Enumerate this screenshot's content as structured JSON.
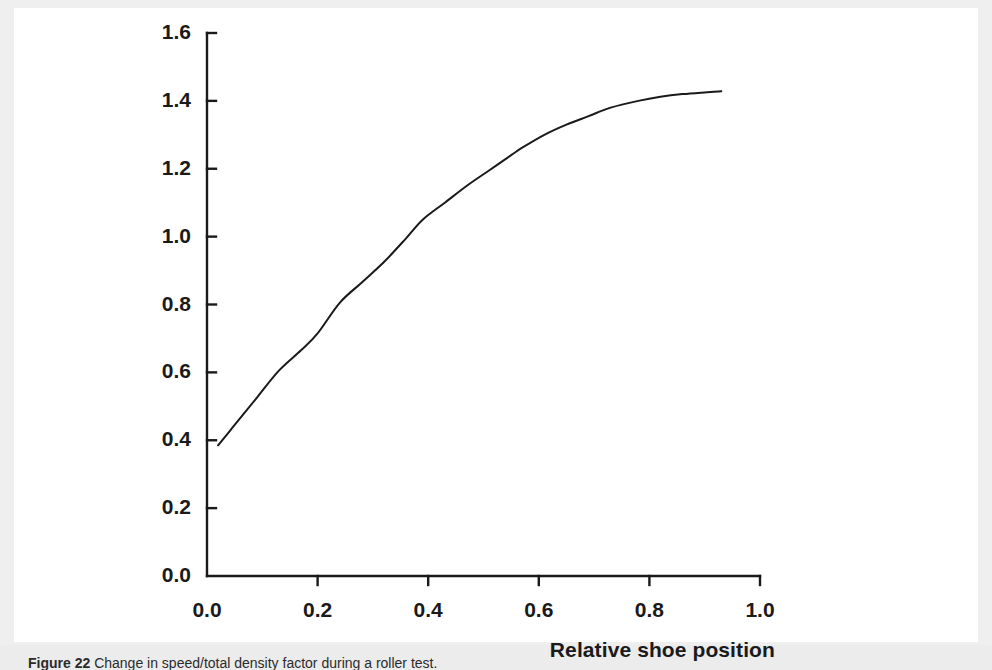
{
  "figure": {
    "caption_label": "Figure 22",
    "caption_sep": "   ",
    "caption_body": "Change in speed/total density factor during a roller test."
  },
  "chart_data": {
    "type": "line",
    "title": "",
    "subtitle": "",
    "xlabel": "Relative shoe position",
    "ylabel": "",
    "xlim": [
      0.0,
      1.0
    ],
    "ylim": [
      0.0,
      1.6
    ],
    "xticks": [
      "0.0",
      "0.2",
      "0.4",
      "0.6",
      "0.8",
      "1.0"
    ],
    "xtick_values": [
      0.0,
      0.2,
      0.4,
      0.6,
      0.8,
      1.0
    ],
    "yticks": [
      "0.0",
      "0.2",
      "0.4",
      "0.6",
      "0.8",
      "1.0",
      "1.2",
      "1.4",
      "1.6"
    ],
    "ytick_values": [
      0.0,
      0.2,
      0.4,
      0.6,
      0.8,
      1.0,
      1.2,
      1.4,
      1.6
    ],
    "grid": false,
    "legend": "none",
    "tick_direction": "in",
    "line_color": "#1a1a1a",
    "line_width": 2,
    "series": [
      {
        "name": "density factor",
        "x": [
          0.02,
          0.04,
          0.06,
          0.09,
          0.13,
          0.17,
          0.2,
          0.24,
          0.28,
          0.32,
          0.36,
          0.39,
          0.43,
          0.47,
          0.51,
          0.55,
          0.57,
          0.61,
          0.65,
          0.69,
          0.73,
          0.78,
          0.82,
          0.86,
          0.9,
          0.93
        ],
        "y": [
          0.385,
          0.425,
          0.465,
          0.525,
          0.605,
          0.665,
          0.715,
          0.805,
          0.865,
          0.925,
          0.995,
          1.05,
          1.1,
          1.15,
          1.195,
          1.24,
          1.262,
          1.3,
          1.33,
          1.355,
          1.38,
          1.4,
          1.412,
          1.42,
          1.425,
          1.428
        ]
      }
    ]
  },
  "geometry": {
    "x_axis_left_px": 193,
    "x_axis_right_px": 746,
    "y_axis_bottom_px": 568,
    "y_axis_top_px": 25
  }
}
